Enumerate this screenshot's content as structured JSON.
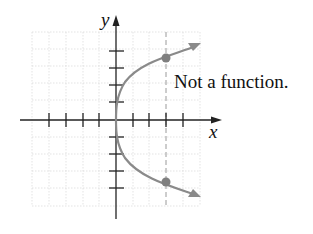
{
  "diagram": {
    "caption": "Not a function.",
    "x_axis_label": "x",
    "y_axis_label": "y",
    "grid": {
      "x_min": 32,
      "x_max": 200,
      "y_min": 32,
      "y_max": 207,
      "step": 8.4
    },
    "origin": {
      "x": 116,
      "y": 120
    },
    "tick_spacing": 16.8,
    "x_ticks": [
      -4,
      -3,
      -2,
      -1,
      1,
      2,
      3,
      4
    ],
    "y_ticks": [
      4,
      3,
      2,
      1,
      -1,
      -2,
      -3,
      -4
    ],
    "vertical_line_test_x": 3,
    "points": [
      {
        "name": "upper-intersection",
        "x": 3,
        "y": 3.7
      },
      {
        "name": "lower-intersection",
        "x": 3,
        "y": -3.7
      }
    ],
    "curve": "x = y^2 / k (sideways parabola opening right)",
    "colors": {
      "curve": "#8a8a8a",
      "points": "#7f7f7f",
      "axes": "#222222",
      "grid": "#d8d8d8",
      "dashed_line": "#9a9a9a"
    }
  }
}
